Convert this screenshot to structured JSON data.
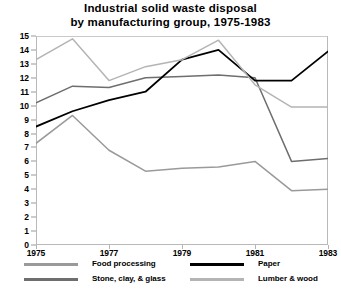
{
  "chart_data": {
    "type": "line",
    "title": "Industrial solid waste disposal by manufacturing group, 1975-1983",
    "title_lines": [
      "Industrial solid waste disposal",
      "by manufacturing group, 1975-1983"
    ],
    "xlabel": "",
    "ylabel": "",
    "x": [
      1975,
      1976,
      1977,
      1978,
      1979,
      1980,
      1981,
      1982,
      1983
    ],
    "xlim": [
      1975,
      1983
    ],
    "ylim": [
      0,
      15
    ],
    "xticks": [
      1975,
      1977,
      1979,
      1981,
      1983
    ],
    "xtick_labels": [
      "1975",
      "1977",
      "1979",
      "1981",
      "1983"
    ],
    "yticks": [
      0,
      1,
      2,
      3,
      4,
      5,
      6,
      7,
      8,
      9,
      10,
      11,
      12,
      13,
      14,
      15
    ],
    "ytick_labels": [
      "0",
      "1",
      "2",
      "3",
      "4",
      "5",
      "6",
      "7",
      "8",
      "9",
      "10",
      "11",
      "12",
      "13",
      "14",
      "15"
    ],
    "grid": false,
    "legend_position": "bottom",
    "series": [
      {
        "name": "Food processing",
        "color": "#9a9a9a",
        "values": [
          7.3,
          9.3,
          6.8,
          5.3,
          5.5,
          5.6,
          6.0,
          3.9,
          4.0
        ]
      },
      {
        "name": "Stone, clay, & glass",
        "color": "#6e6e6e",
        "values": [
          10.2,
          11.4,
          11.3,
          12.0,
          12.1,
          12.2,
          12.0,
          6.0,
          6.2
        ]
      },
      {
        "name": "Paper",
        "color": "#000000",
        "values": [
          8.5,
          9.6,
          10.4,
          11.0,
          13.3,
          14.0,
          11.8,
          11.8,
          13.9
        ]
      },
      {
        "name": "Lumber & wood",
        "color": "#b4b4b4",
        "values": [
          13.3,
          14.8,
          11.8,
          12.8,
          13.3,
          14.7,
          11.5,
          9.9,
          9.9
        ]
      }
    ]
  },
  "legend": {
    "entries": [
      {
        "label": "Food processing",
        "color": "#9a9a9a"
      },
      {
        "label": "Stone, clay, & glass",
        "color": "#6e6e6e"
      },
      {
        "label": "Paper",
        "color": "#000000"
      },
      {
        "label": "Lumber & wood",
        "color": "#b4b4b4"
      }
    ]
  }
}
